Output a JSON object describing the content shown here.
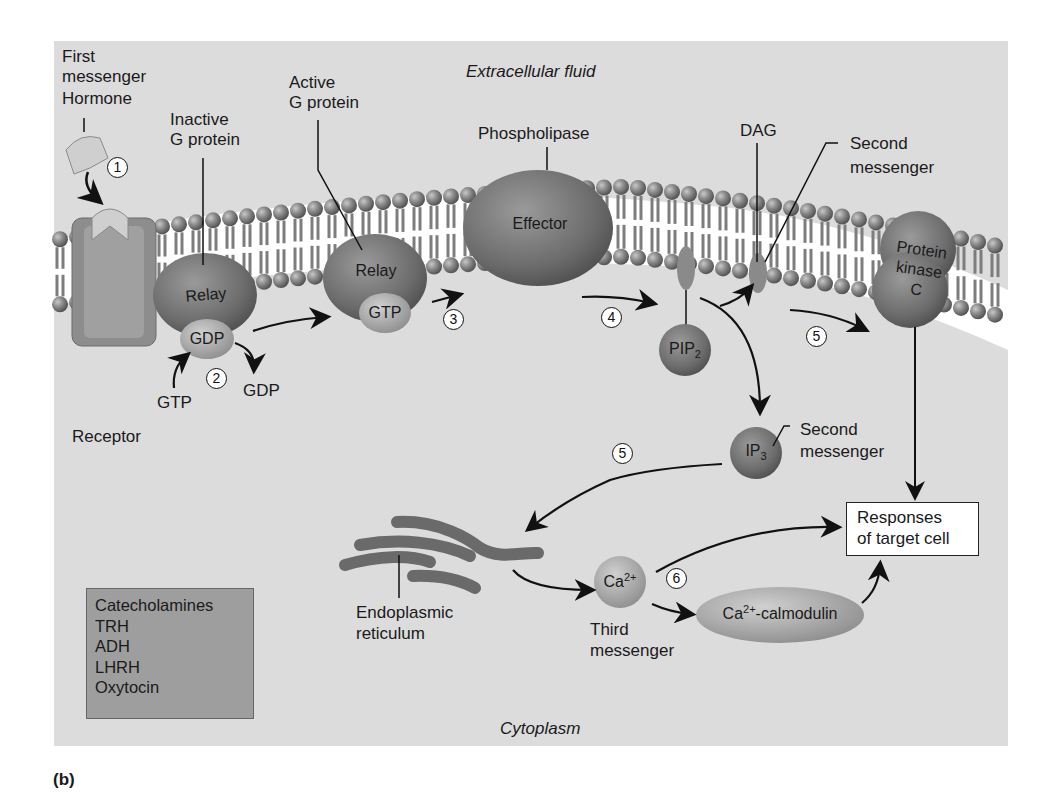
{
  "figure": {
    "panel_letter": "(b)",
    "regions": {
      "outside": "Extracellular fluid",
      "inside": "Cytoplasm"
    },
    "labels": {
      "first_messenger": [
        "First",
        "messenger",
        "Hormone"
      ],
      "inactive_g": [
        "Inactive",
        "G protein"
      ],
      "active_g": [
        "Active",
        "G protein"
      ],
      "phospholipase": "Phospholipase",
      "dag": "DAG",
      "second_messenger_top": [
        "Second",
        "messenger"
      ],
      "receptor": "Receptor",
      "gtp_in": "GTP",
      "gdp_out": "GDP",
      "second_messenger_ip3": [
        "Second",
        "messenger"
      ],
      "er": [
        "Endoplasmic",
        "reticulum"
      ],
      "third_messenger": [
        "Third",
        "messenger"
      ]
    },
    "molecules": {
      "relay_inactive": "Relay",
      "gdp_bound": "GDP",
      "relay_active": "Relay",
      "gtp_bound": "GTP",
      "effector": "Effector",
      "pip2": {
        "base": "PIP",
        "sub": "2"
      },
      "pkc": [
        "Protein",
        "kinase",
        "C"
      ],
      "ip3": {
        "base": "IP",
        "sub": "3"
      },
      "ca": {
        "base": "Ca",
        "sup": "2+"
      },
      "ca_calmodulin": {
        "base": "Ca",
        "sup": "2+",
        "rest": "-calmodulin"
      }
    },
    "steps": [
      "1",
      "2",
      "3",
      "4",
      "5",
      "5",
      "6"
    ],
    "responses": [
      "Responses",
      "of target cell"
    ],
    "hormone_list": [
      "Catecholamines",
      "TRH",
      "ADH",
      "LHRH",
      "Oxytocin"
    ],
    "colors": {
      "background": "#dcdcdc",
      "membrane_head": "#7a7a7a",
      "protein": "#6f6f6f",
      "list_box": "#9e9e9e",
      "er": "#6a6a6a"
    }
  }
}
